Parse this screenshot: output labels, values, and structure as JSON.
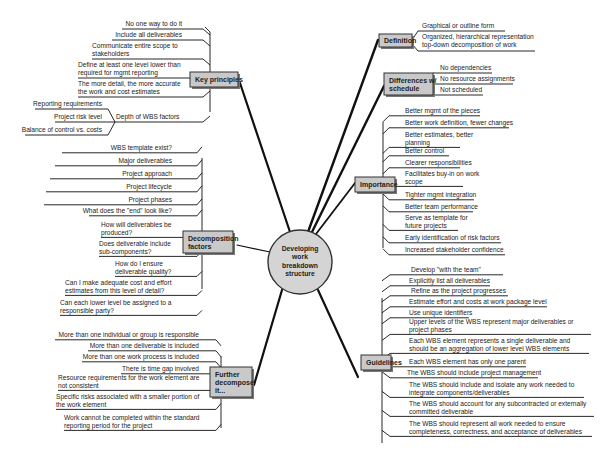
{
  "center": {
    "lines": [
      "Developing",
      "work",
      "breakdown",
      "structure"
    ]
  },
  "colors": {
    "topic_fill": "#c9c9c9",
    "topic_border": "#333333",
    "center_fill": "#d4d4d4",
    "line": "#111111"
  },
  "topics": {
    "key_principles": {
      "label": [
        "Key principles"
      ],
      "items": [
        [
          "No one way to do it"
        ],
        [
          "Include all deliverables"
        ],
        [
          "Communicate entire scope to",
          "stakeholders"
        ],
        [
          "Define at least one level lower than",
          "required for mgmt reporting"
        ],
        [
          "The more detail, the more accurate",
          "the work and cost estimates"
        ],
        [
          "Depth of WBS factors"
        ]
      ],
      "sub_items": [
        [
          "Reporting requirements"
        ],
        [
          "Project risk level"
        ],
        [
          "Balance of control vs. costs"
        ]
      ]
    },
    "decomposition": {
      "label": [
        "Decomposition",
        "factors"
      ],
      "items": [
        [
          "WBS template exist?"
        ],
        [
          "Major deliverables"
        ],
        [
          "Project approach"
        ],
        [
          "Project lifecycle"
        ],
        [
          "Project phases"
        ],
        [
          "What does the \"end\" look like?"
        ],
        [
          "How will deliverables be",
          "produced?"
        ],
        [
          "Does deliverable include",
          "sub-components?"
        ],
        [
          "How do I ensure",
          "deliverable quality?"
        ],
        [
          "Can I make adequate cost and effort",
          "estimates from this level of detail?"
        ],
        [
          "Can each lower level be assigned to a",
          "responsible party?"
        ]
      ]
    },
    "further": {
      "label": [
        "Further",
        "decompose",
        "it..."
      ],
      "items": [
        [
          "More than one individual or group is responsible"
        ],
        [
          "More than one deliverable is included"
        ],
        [
          "More than one work process is included"
        ],
        [
          "There is time gap involved"
        ],
        [
          "Resource requirements for the work element are",
          "not consistent"
        ],
        [
          "Specific risks associated with a smaller portion of",
          "the work element"
        ],
        [
          "Work cannot be completed within the standard",
          "reporting period for the project"
        ]
      ]
    },
    "definition": {
      "label": [
        "Definition"
      ],
      "items": [
        [
          "Graphical or outline form"
        ],
        [
          "Organized, hierarchical representation",
          "top-down decomposition of work"
        ]
      ]
    },
    "differences": {
      "label": [
        "Differences w/",
        "schedule"
      ],
      "items": [
        [
          "No dependencies"
        ],
        [
          "No resource assignments"
        ],
        [
          "Not scheduled"
        ]
      ]
    },
    "importance": {
      "label": [
        "Importance"
      ],
      "items": [
        [
          "Better mgmt of the pieces"
        ],
        [
          "Better work definition, fewer changes"
        ],
        [
          "Better estimates, better",
          "planning"
        ],
        [
          "Better control"
        ],
        [
          "Clearer responsibilities"
        ],
        [
          "Facilitates buy-in on work",
          "scope"
        ],
        [
          "Tighter mgmt integration"
        ],
        [
          "Better team performance"
        ],
        [
          "Serve as template for",
          "future projects"
        ],
        [
          "Early identification of risk factors"
        ],
        [
          "Increased stakeholder confidence"
        ]
      ]
    },
    "guidelines": {
      "label": [
        "Guidelines"
      ],
      "items": [
        [
          "Develop \"with the team\""
        ],
        [
          "Explicitly list all deliverables"
        ],
        [
          "Refine as the project progresses"
        ],
        [
          "Estimate effort and costs at work package level"
        ],
        [
          "Use unique identifiers"
        ],
        [
          "Upper levels of the WBS represent major deliverables or",
          "project phases"
        ],
        [
          "Each WBS element represents a single deliverable and",
          "should be an aggregation of lower level WBS elements"
        ],
        [
          "Each WBS element has only one parent"
        ],
        [
          "The WBS should include project management"
        ],
        [
          "The WBS should include and isolate any work needed to",
          "integrate components/deliverables"
        ],
        [
          "The WBS should account for any subcontracted or externally",
          "committed deliverable"
        ],
        [
          "The WBS should represent all work needed to ensure",
          "completeness, correctness, and acceptance of deliverables"
        ]
      ]
    }
  }
}
